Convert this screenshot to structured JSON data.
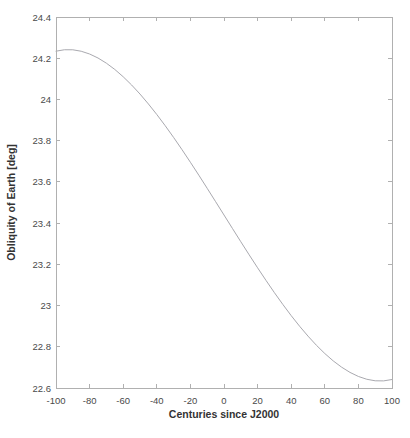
{
  "figure": {
    "background": "#ffffff"
  },
  "chart_data": {
    "type": "line",
    "title": "",
    "xlabel": "Centuries since J2000",
    "ylabel": "Obliquity of Earth [deg]",
    "xlim": [
      -100,
      100
    ],
    "ylim": [
      22.6,
      24.4
    ],
    "x_ticks": [
      -100,
      -80,
      -60,
      -40,
      -20,
      0,
      20,
      40,
      60,
      80,
      100
    ],
    "x_tick_labels": [
      "-100",
      "-80",
      "-60",
      "-40",
      "-20",
      "0",
      "20",
      "40",
      "60",
      "80",
      "100"
    ],
    "y_ticks": [
      22.6,
      22.8,
      23.0,
      23.2,
      23.4,
      23.6,
      23.8,
      24.0,
      24.2,
      24.4
    ],
    "y_tick_labels": [
      "22.6",
      "22.8",
      "23",
      "23.2",
      "23.4",
      "23.6",
      "23.8",
      "24",
      "24.2",
      "24.4"
    ],
    "grid": false,
    "box": true,
    "tick_direction": "in",
    "legend": "none",
    "series": [
      {
        "name": "obliquity",
        "x": [
          -100,
          -95,
          -90,
          -85,
          -80,
          -75,
          -70,
          -65,
          -60,
          -55,
          -50,
          -45,
          -40,
          -35,
          -30,
          -25,
          -20,
          -15,
          -10,
          -5,
          0,
          5,
          10,
          15,
          20,
          25,
          30,
          35,
          40,
          45,
          50,
          55,
          60,
          65,
          70,
          75,
          80,
          85,
          90,
          95,
          100
        ],
        "y": [
          24.2341,
          24.2411,
          24.2409,
          24.2339,
          24.2205,
          24.2011,
          24.1759,
          24.1455,
          24.1101,
          24.0702,
          24.0261,
          23.9782,
          23.9269,
          23.8726,
          23.8157,
          23.7564,
          23.6953,
          23.6326,
          23.5688,
          23.5042,
          23.4393,
          23.3744,
          23.3097,
          23.2459,
          23.1832,
          23.122,
          23.0626,
          23.0056,
          22.9511,
          22.8997,
          22.8517,
          22.8074,
          22.7673,
          22.7317,
          22.7011,
          22.6757,
          22.656,
          22.6423,
          22.635,
          22.6345,
          22.6412
        ]
      }
    ],
    "colors": {
      "line": "#a9a9af",
      "axis": "#b0b0b0",
      "tick_label": "#4a4a4a",
      "axis_label": "#333333",
      "background": "#ffffff"
    }
  }
}
